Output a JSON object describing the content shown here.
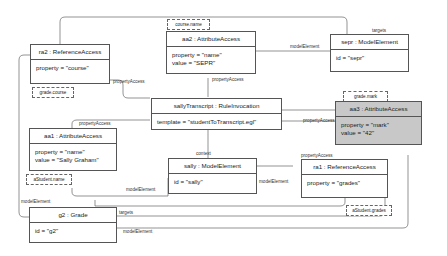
{
  "diagram": {
    "nodes": {
      "ra2": {
        "title": "ra2 : ReferenceAccess",
        "attrs": [
          "property = \"course\""
        ],
        "tag": "grade.course"
      },
      "aa2": {
        "title": "aa2 : AttributeAccess",
        "attrs": [
          "property = \"name\"",
          "value = \"SEPR\""
        ],
        "tag": "course.name"
      },
      "sepr": {
        "title": "sepr : ModelElement",
        "attrs": [
          "id = \"sepr\""
        ]
      },
      "sallyTranscript": {
        "title": "sallyTranscript : RuleInvocation",
        "attrs": [
          "template = \"studentToTranscript.egl\""
        ]
      },
      "aa3": {
        "title": "aa3 : AttributeAccess",
        "attrs": [
          "property = \"mark\"",
          "value = \"42\""
        ],
        "tag": "grade.mark",
        "fill": "#c8c8c8"
      },
      "aa1": {
        "title": "aa1 : AttributeAccess",
        "attrs": [
          "property = \"name\"",
          "value = \"Sally Graham\""
        ],
        "tag": "aStudent.name"
      },
      "sally": {
        "title": "sally : ModelElement",
        "attrs": [
          "id = \"sally\""
        ]
      },
      "ra1": {
        "title": "ra1 : ReferenceAccess",
        "attrs": [
          "property = \"grades\""
        ],
        "tag": "aStudent.grades"
      },
      "g2": {
        "title": "g2 : Grade",
        "attrs": [
          "id = \"g2\""
        ]
      }
    },
    "edge_labels": {
      "targets_top": "targets",
      "modelElement_aa2_sepr": "modelElement",
      "propertyAccess_ra2": "propertyAccess",
      "propertyAccess_aa2": "propertyAccess",
      "propertyAccess_aa1": "propertyAccess",
      "propertyAccess_aa3": "propertyAccess",
      "propertyAccess_ra1": "propertyAccess",
      "context": "context",
      "modelElement_aa1_sally": "modelElement",
      "modelElement_sally_ra1": "modelElement",
      "modelElement_left": "modelElement",
      "targets_g2": "targets",
      "modelElement_g2": "modelElement"
    }
  }
}
